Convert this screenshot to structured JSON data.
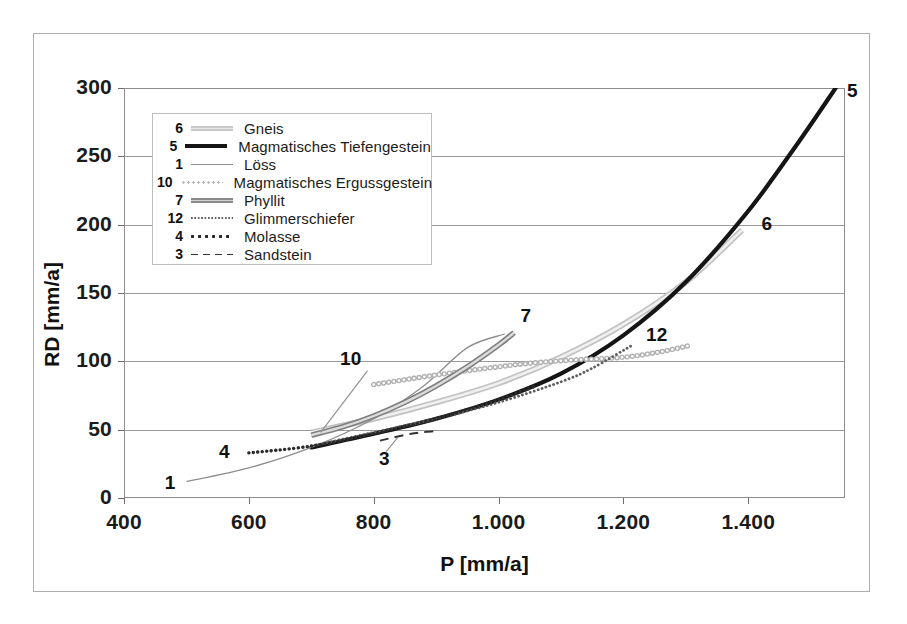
{
  "chart_data": {
    "type": "line",
    "title": "",
    "xlabel": "P [mm/a]",
    "ylabel": "RD [mm/a]",
    "xlim": [
      400,
      1555
    ],
    "ylim": [
      0,
      300
    ],
    "xticks": [
      400,
      600,
      800,
      1000,
      1200,
      1400
    ],
    "xtick_labels": [
      "400",
      "600",
      "800",
      "1.000",
      "1.200",
      "1.400"
    ],
    "yticks": [
      0,
      50,
      100,
      150,
      200,
      250,
      300
    ],
    "ytick_labels": [
      "0",
      "50",
      "100",
      "150",
      "200",
      "250",
      "300"
    ],
    "grid": "horizontal",
    "legend_position": "upper-left-inside",
    "series": [
      {
        "key": "gneis",
        "number": "6",
        "name": "Gneis",
        "style": "double-rail-light-gray",
        "color": "#c9c9c9",
        "end_label": "6",
        "points": [
          [
            700,
            48
          ],
          [
            800,
            58
          ],
          [
            900,
            70
          ],
          [
            1000,
            84
          ],
          [
            1100,
            103
          ],
          [
            1200,
            127
          ],
          [
            1300,
            158
          ],
          [
            1390,
            196
          ]
        ]
      },
      {
        "key": "magmatisches_tiefengestein",
        "number": "5",
        "name": "Magmatisches Tiefengestein",
        "style": "thick-solid-black",
        "color": "#151515",
        "end_label": "5",
        "points": [
          [
            700,
            37
          ],
          [
            800,
            47
          ],
          [
            900,
            58
          ],
          [
            1000,
            72
          ],
          [
            1100,
            91
          ],
          [
            1200,
            119
          ],
          [
            1300,
            158
          ],
          [
            1400,
            210
          ],
          [
            1480,
            260
          ],
          [
            1540,
            300
          ]
        ]
      },
      {
        "key": "loess",
        "number": "1",
        "name": "Löss",
        "style": "thin-solid-gray",
        "color": "#8e8e8e",
        "end_label": "1",
        "points": [
          [
            500,
            12
          ],
          [
            600,
            22
          ],
          [
            700,
            37
          ],
          [
            800,
            58
          ],
          [
            880,
            82
          ],
          [
            950,
            110
          ],
          [
            1010,
            120
          ]
        ]
      },
      {
        "key": "magmatisches_ergussgestein",
        "number": "10",
        "name": "Magmatisches Ergussgestein",
        "style": "circle-chain-light",
        "color": "#b6b6b6",
        "end_label": "10",
        "points": [
          [
            800,
            83
          ],
          [
            900,
            90
          ],
          [
            1000,
            96
          ],
          [
            1060,
            99
          ],
          [
            1120,
            101
          ],
          [
            1200,
            103
          ],
          [
            1260,
            107
          ],
          [
            1310,
            112
          ]
        ]
      },
      {
        "key": "phyllit",
        "number": "7",
        "name": "Phyllit",
        "style": "double-rail-gray",
        "color": "#8a8a8a",
        "end_label": "7",
        "points": [
          [
            700,
            46
          ],
          [
            750,
            52
          ],
          [
            800,
            60
          ],
          [
            850,
            70
          ],
          [
            900,
            82
          ],
          [
            950,
            96
          ],
          [
            1000,
            112
          ],
          [
            1025,
            121
          ]
        ]
      },
      {
        "key": "glimmerschiefer",
        "number": "12",
        "name": "Glimmerschiefer",
        "style": "fine-dotted",
        "color": "#5f5f5f",
        "end_label": "12",
        "points": [
          [
            700,
            38
          ],
          [
            800,
            48
          ],
          [
            900,
            58
          ],
          [
            1000,
            70
          ],
          [
            1100,
            85
          ],
          [
            1150,
            95
          ],
          [
            1215,
            112
          ]
        ]
      },
      {
        "key": "molasse",
        "number": "4",
        "name": "Molasse",
        "style": "round-dotted",
        "color": "#2a2a2a",
        "end_label": "4",
        "points": [
          [
            600,
            33
          ],
          [
            700,
            38
          ],
          [
            800,
            47
          ],
          [
            900,
            58
          ],
          [
            1000,
            72
          ],
          [
            1060,
            82
          ]
        ]
      },
      {
        "key": "sandstein",
        "number": "3",
        "name": "Sandstein",
        "style": "dashed",
        "color": "#333333",
        "end_label": "3",
        "points": [
          [
            810,
            42
          ],
          [
            860,
            47
          ],
          [
            900,
            49
          ]
        ]
      }
    ]
  },
  "legend": {
    "rows": [
      {
        "num": "6",
        "label": "Gneis"
      },
      {
        "num": "5",
        "label": "Magmatisches Tiefengestein"
      },
      {
        "num": "1",
        "label": "Löss"
      },
      {
        "num": "10",
        "label": "Magmatisches Ergussgestein"
      },
      {
        "num": "7",
        "label": "Phyllit"
      },
      {
        "num": "12",
        "label": "Glimmerschiefer"
      },
      {
        "num": "4",
        "label": "Molasse"
      },
      {
        "num": "3",
        "label": "Sandstein"
      }
    ]
  },
  "curve_labels": {
    "gneis": "6",
    "magmatisches_tiefengestein": "5",
    "loess": "1",
    "magmatisches_ergussgestein": "10",
    "phyllit": "7",
    "glimmerschiefer": "12",
    "molasse": "4",
    "sandstein": "3"
  },
  "colors": {
    "axis": "#8d8d8d",
    "grid": "#9a9a9a",
    "frame": "#adadad",
    "text": "#1b1b1b"
  }
}
